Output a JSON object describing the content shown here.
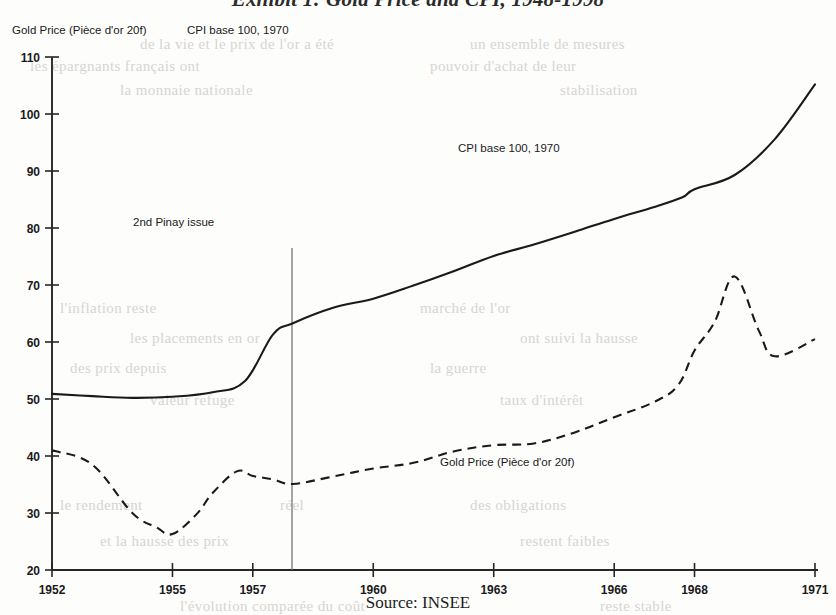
{
  "title": "Exhibit 1: Gold Price and CPI, 1948-1998",
  "source_caption": "Source: INSEE",
  "header_legend": {
    "gold_label": "Gold Price (Pièce d'or 20f)",
    "cpi_label": "CPI base 100, 1970"
  },
  "annotations": {
    "pinay": "2nd Pinay issue",
    "cpi_inline": "CPI base 100, 1970",
    "gold_inline": "Gold Price (Pièce d'or 20f)"
  },
  "colors": {
    "ink": "#1a1a1a",
    "axis": "#262626",
    "marker_line": "#6b6b6b",
    "page": "#fdfdfc"
  },
  "ghost_text": [
    {
      "text": "de  la  vie  et  le  prix  de  l'or  a  été",
      "x": 140,
      "y": 36
    },
    {
      "text": "un  ensemble  de  mesures",
      "x": 470,
      "y": 36
    },
    {
      "text": "les  épargnants  français  ont",
      "x": 30,
      "y": 58
    },
    {
      "text": "pouvoir  d'achat  de  leur",
      "x": 430,
      "y": 58
    },
    {
      "text": "la  monnaie  nationale",
      "x": 120,
      "y": 82
    },
    {
      "text": "stabilisation",
      "x": 560,
      "y": 82
    },
    {
      "text": "l'inflation  reste",
      "x": 60,
      "y": 300
    },
    {
      "text": "marché  de  l'or",
      "x": 420,
      "y": 300
    },
    {
      "text": "les  placements  en  or",
      "x": 130,
      "y": 330
    },
    {
      "text": "ont  suivi  la  hausse",
      "x": 520,
      "y": 330
    },
    {
      "text": "des  prix  depuis",
      "x": 70,
      "y": 360
    },
    {
      "text": "la  guerre",
      "x": 430,
      "y": 360
    },
    {
      "text": "valeur  refuge",
      "x": 150,
      "y": 392
    },
    {
      "text": "taux  d'intérêt",
      "x": 500,
      "y": 392
    },
    {
      "text": "le  rendement",
      "x": 60,
      "y": 497
    },
    {
      "text": "réel",
      "x": 280,
      "y": 497
    },
    {
      "text": "des  obligations",
      "x": 470,
      "y": 497
    },
    {
      "text": "et  la  hausse  des  prix",
      "x": 100,
      "y": 533
    },
    {
      "text": "restent  faibles",
      "x": 520,
      "y": 533
    },
    {
      "text": "l'évolution  comparée  du  coût",
      "x": 180,
      "y": 598
    },
    {
      "text": "reste  stable",
      "x": 600,
      "y": 598
    }
  ],
  "chart_data": {
    "type": "line",
    "title": "Exhibit 1: Gold Price and CPI, 1948-1998",
    "xlabel": "",
    "ylabel": "",
    "xlim": [
      1952,
      1971
    ],
    "ylim": [
      20,
      110
    ],
    "ytick_values": [
      20,
      30,
      40,
      50,
      60,
      70,
      80,
      90,
      100,
      110
    ],
    "xtick_values": [
      1952,
      1955,
      1957,
      1960,
      1963,
      1966,
      1968,
      1971
    ],
    "xtick_labels": [
      "1952",
      "1955",
      "1957",
      "1960",
      "1963",
      "1966",
      "1968",
      "1971"
    ],
    "grid": false,
    "legend_position": "inline-annotations",
    "annotations": [
      {
        "text": "2nd Pinay issue",
        "type": "vertical-marker",
        "x": 1957.5,
        "label_x": 1954.4,
        "label_y": 78.5
      }
    ],
    "series": [
      {
        "name": "CPI base 100, 1970",
        "style": "solid",
        "color": "#1a1a1a",
        "x": [
          1952,
          1953,
          1954,
          1955,
          1956,
          1956.8,
          1957.5,
          1958,
          1959,
          1960,
          1961,
          1962,
          1963,
          1964,
          1965,
          1966,
          1967,
          1967.7,
          1968,
          1969,
          1970,
          1971
        ],
        "values": [
          50.9,
          50.5,
          50.2,
          50.4,
          51.2,
          53.1,
          61.3,
          63.3,
          66.0,
          67.6,
          69.9,
          72.4,
          75.1,
          77.1,
          79.3,
          81.6,
          83.7,
          85.4,
          86.8,
          89.3,
          95.6,
          105.2
        ]
      },
      {
        "name": "Gold Price (Pièce d'or 20f)",
        "style": "dashed",
        "color": "#1a1a1a",
        "x": [
          1952,
          1953,
          1954,
          1954.6,
          1955,
          1955.6,
          1956,
          1956.6,
          1957,
          1957.5,
          1958,
          1959,
          1960,
          1961,
          1962,
          1963,
          1964,
          1965,
          1966,
          1967,
          1967.6,
          1968,
          1968.5,
          1969,
          1969.6,
          1970,
          1971
        ],
        "values": [
          41.0,
          38.5,
          30.0,
          27.5,
          26.3,
          29.8,
          33.5,
          37.3,
          36.5,
          35.9,
          35.1,
          36.4,
          37.8,
          38.8,
          40.8,
          41.9,
          42.2,
          44.1,
          46.8,
          49.5,
          52.5,
          58.5,
          63.5,
          71.5,
          62.0,
          57.5,
          60.5
        ]
      }
    ]
  }
}
